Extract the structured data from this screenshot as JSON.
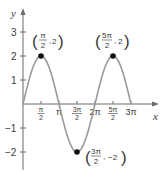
{
  "chart_data": {
    "type": "line",
    "title": "",
    "function": "y = 2 sin x",
    "xlabel": "x",
    "ylabel": "y",
    "xlim": [
      0,
      9.42477796
    ],
    "ylim": [
      -2.5,
      3.5
    ],
    "grid": false,
    "legend": null,
    "x_ticks": [
      {
        "value": 1.5707963,
        "num": "π",
        "den": "2"
      },
      {
        "value": 3.1415927,
        "label": "π"
      },
      {
        "value": 4.712389,
        "num": "3π",
        "den": "2"
      },
      {
        "value": 6.2831853,
        "label": "2π"
      },
      {
        "value": 7.8539816,
        "num": "5π",
        "den": "2"
      },
      {
        "value": 9.424778,
        "label": "3π"
      }
    ],
    "y_ticks": [
      {
        "value": 3,
        "label": "3"
      },
      {
        "value": 2,
        "label": "2"
      },
      {
        "value": 1,
        "label": "1"
      },
      {
        "value": -1,
        "label": "−1"
      },
      {
        "value": -2,
        "label": "−2"
      }
    ],
    "series": [
      {
        "name": "2 sin x",
        "x": [
          0,
          0.785,
          1.571,
          2.356,
          3.142,
          3.927,
          4.712,
          5.498,
          6.283,
          7.069,
          7.854,
          8.639,
          9.425
        ],
        "y": [
          0,
          1.414,
          2,
          1.414,
          0,
          -1.414,
          -2,
          -1.414,
          0,
          1.414,
          2,
          1.414,
          0
        ]
      }
    ],
    "annotations": [
      {
        "x": 1.5707963,
        "y": 2,
        "num": "π",
        "den": "2",
        "yval": "2",
        "text": "(π/2, 2)"
      },
      {
        "x": 4.712389,
        "y": -2,
        "num": "3π",
        "den": "2",
        "yval": "−2",
        "text": "(3π/2, −2)"
      },
      {
        "x": 7.8539816,
        "y": 2,
        "num": "5π",
        "den": "2",
        "yval": "2",
        "text": "(5π/2, 2)"
      }
    ]
  },
  "labels": {
    "x_axis": "x",
    "y_axis": "y",
    "yt3": "3",
    "yt2": "2",
    "yt1": "1",
    "ytm1": "−1",
    "ytm2": "−2",
    "xt_pi2_num": "π",
    "xt_pi2_den": "2",
    "xt_pi": "π",
    "xt_3pi2_num": "3π",
    "xt_3pi2_den": "2",
    "xt_2pi": "2π",
    "xt_5pi2_num": "5π",
    "xt_5pi2_den": "2",
    "xt_3pi": "3π",
    "a1_num": "π",
    "a1_den": "2",
    "a1_y": "2",
    "a2_num": "3π",
    "a2_den": "2",
    "a2_y": "−2",
    "a3_num": "5π",
    "a3_den": "2",
    "a3_y": "2",
    "open_paren": "(",
    "close_paren": ")",
    "comma": ","
  }
}
